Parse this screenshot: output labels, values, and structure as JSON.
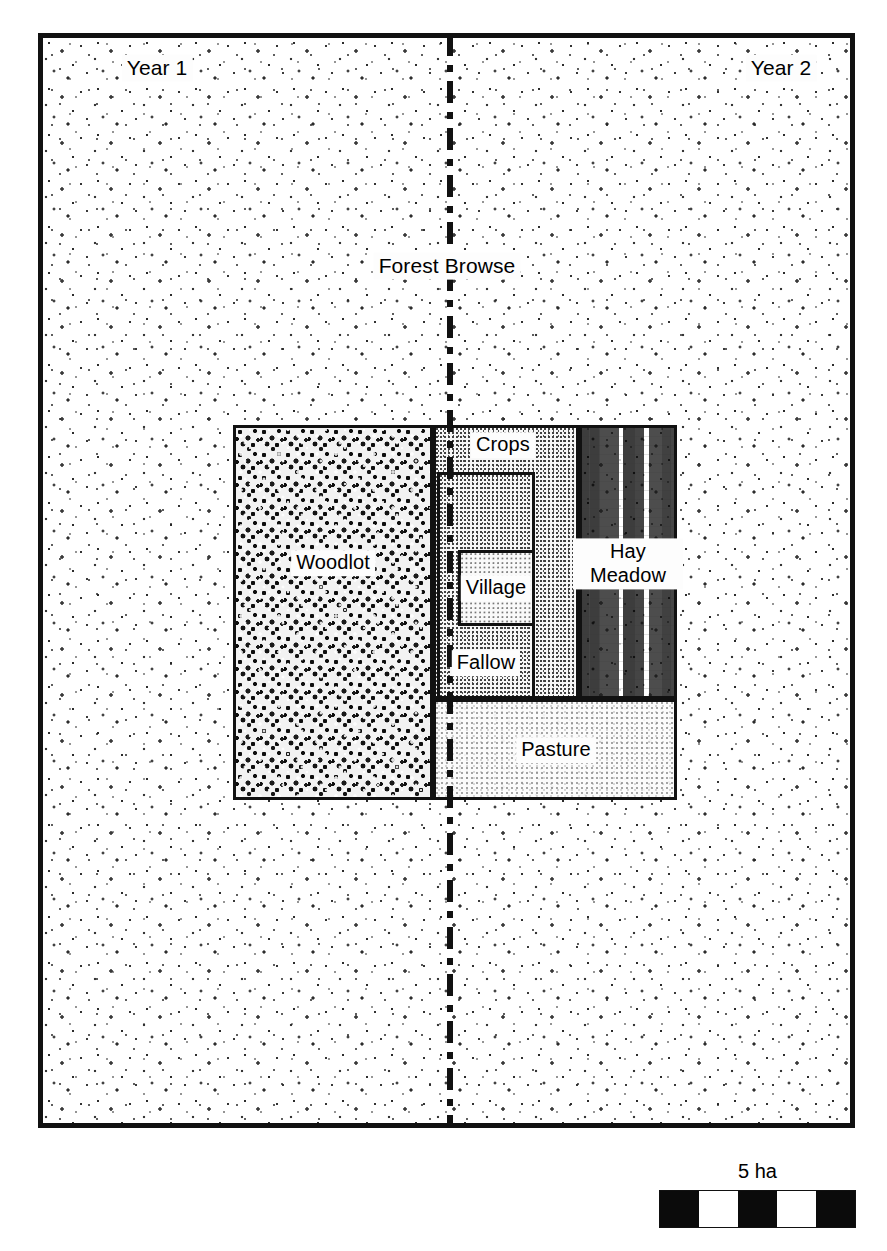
{
  "figure": {
    "name": "medieval-open-field-farm-plan",
    "frame": {
      "border_color": "#111111"
    }
  },
  "regions": {
    "forest_browse": {
      "label": "Forest Browse",
      "texture": "sparse-scrub-stipple"
    },
    "woodlot": {
      "label": "Woodlot",
      "texture": "dense-tree-crown-stipple"
    },
    "crops": {
      "label": "Crops",
      "texture": "fine-stipple"
    },
    "fallow": {
      "label": "Fallow",
      "texture": "fine-stipple"
    },
    "village": {
      "label": "Village",
      "texture": "fine-stipple"
    },
    "hay_meadow": {
      "label": "Hay\nMeadow",
      "label_line1": "Hay",
      "label_line2": "Meadow",
      "texture": "horizontal-grass-dashes"
    },
    "pasture": {
      "label": "Pasture",
      "texture": "fine-stipple"
    }
  },
  "year_labels": {
    "left": "Year 1",
    "right": "Year 2",
    "divider_style": "dash-dot"
  },
  "scale": {
    "caption": "5 ha",
    "segments": [
      "dark",
      "light",
      "dark",
      "light",
      "dark"
    ],
    "segment_count": 5
  },
  "colors": {
    "ink": "#111111",
    "paper": "#ffffff"
  }
}
